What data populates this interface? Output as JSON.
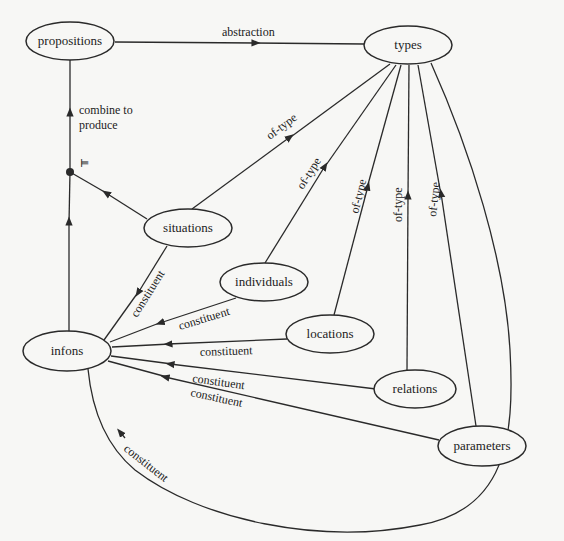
{
  "nodes": {
    "propositions": "propositions",
    "types": "types",
    "situations": "situations",
    "individuals": "individuals",
    "locations": "locations",
    "infons": "infons",
    "relations": "relations",
    "parameters": "parameters"
  },
  "junction_symbol": "⊨",
  "edges": {
    "abstraction": "abstraction",
    "combine_line1": "combine to",
    "combine_line2": "produce",
    "of_type_situations": "of-type",
    "of_type_individuals": "of-type",
    "of_type_locations": "of-type",
    "of_type_relations": "of-type",
    "of_type_parameters": "of-type",
    "constituent_situations": "constituent",
    "constituent_individuals": "constituent",
    "constituent_locations": "constituent",
    "constituent_relations": "constituent",
    "constituent_parameters": "constituent",
    "constituent_types": "constituent"
  },
  "colors": {
    "stroke": "#2a2a2a",
    "background": "#f7f7f5"
  }
}
